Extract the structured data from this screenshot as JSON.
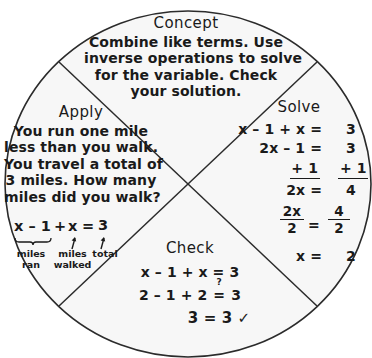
{
  "figure": {
    "type": "concept-wheel-diagram",
    "shape": "circle-divided-into-four-quadrants",
    "background_color": "#ffffff",
    "circle_fill": "#f7f7f7",
    "line_color": "#1a1a1a"
  },
  "quadrants": {
    "concept": {
      "heading": "Concept",
      "lines": [
        "Combine like terms. Use",
        "inverse operations to solve",
        "for the variable. Check",
        "your solution."
      ]
    },
    "apply": {
      "heading": "Apply",
      "lines": [
        "You run one mile",
        "less than you walk.",
        "You travel a total of",
        "3 miles. How many",
        "miles did you walk?"
      ],
      "equation": {
        "braced_term": "x – 1",
        "plus": "+",
        "second_term": "x",
        "equals": "=",
        "result": "3",
        "full": "x – 1 + x = 3"
      },
      "annotations": [
        {
          "label_line1": "miles",
          "label_line2": "ran",
          "marker": "brace"
        },
        {
          "label_line1": "miles",
          "label_line2": "walked",
          "marker": "arrow"
        },
        {
          "label_line1": "total",
          "label_line2": "",
          "marker": "arrow"
        }
      ]
    },
    "solve": {
      "heading": "Solve",
      "steps": [
        {
          "lhs": "x – 1 + x =",
          "rhs": "3",
          "rule_under": false
        },
        {
          "lhs": "2x – 1 =",
          "rhs": "3",
          "rule_under": false
        },
        {
          "lhs": "+ 1",
          "rhs": "+ 1",
          "rule_under": true
        },
        {
          "lhs": "2x =",
          "rhs": "4",
          "rule_under": false
        }
      ],
      "division_step": {
        "left_numerator": "2x",
        "left_denominator": "2",
        "equals": "=",
        "right_numerator": "4",
        "right_denominator": "2"
      },
      "final": {
        "lhs": "x =",
        "rhs": "2"
      }
    },
    "check": {
      "heading": "Check",
      "lines": [
        {
          "text": "x – 1 + x = 3",
          "question_equals": false,
          "indent": false
        },
        {
          "left": "2 – 1 + 2",
          "question_mark": "?",
          "equals": "=",
          "right": "3",
          "question_equals": true,
          "indent": false
        },
        {
          "text": "3 = 3 ✓",
          "question_equals": false,
          "indent": true
        }
      ]
    }
  }
}
